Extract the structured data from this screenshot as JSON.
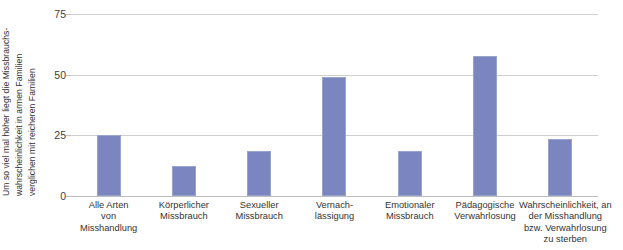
{
  "chart_data": {
    "type": "bar",
    "title": "",
    "xlabel": "",
    "ylabel": "Um so viel mal höher liegt die Missbrauchs- wahrscheinlichkeit in armen Familien verglichen mit reicheren Familien",
    "ylabel_lines": [
      "Um so viel mal höher liegt die Missbrauchs-",
      "wahrscheinlichkeit in armen Familien",
      "verglichen mit reicheren Familien"
    ],
    "ylim": [
      0,
      75
    ],
    "yticks": [
      0,
      25,
      50,
      75
    ],
    "ytick_labels": [
      "0",
      "25",
      "50",
      "75"
    ],
    "grid": true,
    "legend": "none",
    "bar_color": "#7b86c0",
    "gridline_color": "#cfcfcf",
    "categories": [
      "Alle Arten von Misshandlung",
      "Körperlicher Missbrauch",
      "Sexueller Missbrauch",
      "Vernach-lässigung",
      "Emotionaler Missbrauch",
      "Pädagogische Verwahrlosung",
      "Wahrscheinlichkeit, an der Misshandlung bzw. Verwahrlosung zu sterben"
    ],
    "category_lines": [
      [
        "Alle Arten",
        "von",
        "Misshandlung"
      ],
      [
        "Körperlicher",
        "Missbrauch"
      ],
      [
        "Sexueller",
        "Missbrauch"
      ],
      [
        "Vernach-",
        "lässigung"
      ],
      [
        "Emotionaler",
        "Missbrauch"
      ],
      [
        "Pädagogische",
        "Verwahrlosung"
      ],
      [
        "Wahrscheinlichkeit, an",
        "der Misshandlung",
        "bzw. Verwahrlosung",
        "zu sterben"
      ]
    ],
    "values": [
      25,
      12.5,
      18.5,
      49,
      18.5,
      57.5,
      23.5
    ]
  }
}
